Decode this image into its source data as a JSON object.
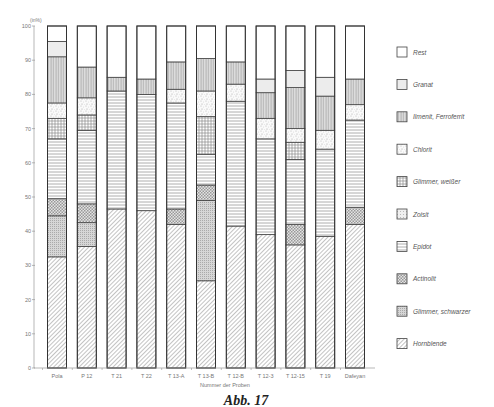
{
  "chart_data": {
    "type": "bar",
    "stacked": true,
    "title": "",
    "caption": "Abb. 17",
    "xlabel": "Nummer der Proben",
    "ylabel": "%",
    "y_unit_label": "(in%)",
    "ylim": [
      0,
      100
    ],
    "yticks": [
      0,
      10,
      20,
      30,
      40,
      50,
      60,
      70,
      80,
      90,
      100
    ],
    "grid": false,
    "legend_position": "right",
    "categories": [
      "Pola",
      "P 12",
      "T 21",
      "T 22",
      "T 13-A",
      "T 13-B",
      "T 12-B",
      "T 12-3",
      "T 12-15",
      "T 19",
      "Dafeyan"
    ],
    "series": [
      {
        "name": "Hornblende",
        "pattern": "diagonal",
        "values": [
          32.5,
          35.5,
          46.5,
          46,
          42,
          25.5,
          41.5,
          39,
          36,
          38.5,
          42
        ]
      },
      {
        "name": "Glimmer, schwarzer",
        "pattern": "dense-dots",
        "values": [
          12,
          7,
          0,
          0,
          0,
          23.5,
          0,
          0,
          0,
          0,
          0
        ]
      },
      {
        "name": "Actinolit",
        "pattern": "checker",
        "values": [
          5,
          5.5,
          0,
          0,
          4.5,
          4.5,
          0,
          0,
          6,
          0,
          5
        ]
      },
      {
        "name": "Epidot",
        "pattern": "horizontal",
        "values": [
          17.5,
          21.5,
          34.5,
          34,
          31,
          9,
          36.5,
          28,
          19,
          25.5,
          25.5
        ]
      },
      {
        "name": "Zoisit",
        "pattern": "fine-dots",
        "values": [
          0,
          0,
          0,
          0,
          0,
          0,
          0,
          0,
          0,
          0,
          0
        ]
      },
      {
        "name": "Glimmer, weißer",
        "pattern": "grid",
        "values": [
          6,
          4.5,
          0,
          0,
          0,
          11,
          0,
          0,
          5,
          0,
          0
        ]
      },
      {
        "name": "Chlorit",
        "pattern": "speckle",
        "values": [
          4.5,
          5,
          0,
          0,
          4,
          7.5,
          5,
          6,
          4,
          5.5,
          4.5
        ]
      },
      {
        "name": "Ilmenit, Ferroferrit",
        "pattern": "vertical",
        "values": [
          13.5,
          9,
          4,
          4.5,
          8,
          9.5,
          6.5,
          7.5,
          12,
          10,
          7.5
        ]
      },
      {
        "name": "Granat",
        "pattern": "light-gray",
        "values": [
          4.5,
          0,
          0,
          0,
          0,
          0,
          0,
          4,
          5,
          5.5,
          0
        ]
      },
      {
        "name": "Rest",
        "pattern": "blank",
        "values": [
          4.5,
          12,
          15,
          15.5,
          10.5,
          9.5,
          10.5,
          15.5,
          13,
          15,
          15.5
        ]
      }
    ]
  },
  "stack_order": [
    "Hornblende",
    "Glimmer, schwarzer",
    "Actinolit",
    "Epidot",
    "Glimmer, weißer",
    "Chlorit",
    "Ilmenit, Ferroferrit",
    "Granat",
    "Rest"
  ],
  "bar_stack_overrides": {
    "T 13-B": [
      "Hornblende",
      "Glimmer, schwarzer",
      "Actinolit",
      "Epidot",
      "Glimmer, weißer",
      "Chlorit",
      "Ilmenit, Ferroferrit",
      "Granat",
      "Rest"
    ],
    "T 12-15": [
      "Hornblende",
      "Glimmer, schwarzer",
      "Actinolit",
      "Epidot",
      "Glimmer, weißer",
      "Chlorit",
      "Ilmenit, Ferroferrit",
      "Granat",
      "Rest"
    ]
  },
  "legend": [
    {
      "label": "Rest",
      "pattern": "blank"
    },
    {
      "label": "Granat",
      "pattern": "light-gray"
    },
    {
      "label": "Ilmenit, Ferroferrit",
      "pattern": "vertical"
    },
    {
      "label": "Chlorit",
      "pattern": "speckle"
    },
    {
      "label": "Glimmer, weißer",
      "pattern": "grid"
    },
    {
      "label": "Zoisit",
      "pattern": "fine-dots"
    },
    {
      "label": "Epidot",
      "pattern": "horizontal"
    },
    {
      "label": "Actinolit",
      "pattern": "checker"
    },
    {
      "label": "Glimmer, schwarzer",
      "pattern": "dense-dots"
    },
    {
      "label": "Hornblende",
      "pattern": "diagonal"
    }
  ]
}
